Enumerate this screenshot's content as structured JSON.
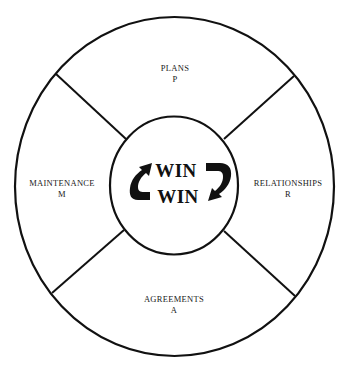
{
  "diagram": {
    "center": {
      "top_word": "WIN",
      "bottom_word": "WIN",
      "arrows": [
        "curved-arrow-up-left",
        "curved-arrow-down-right"
      ]
    },
    "segments": [
      {
        "position": "top",
        "title": "PLANS",
        "letter": "P"
      },
      {
        "position": "right",
        "title": "RELATIONSHIPS",
        "letter": "R"
      },
      {
        "position": "bottom",
        "title": "AGREEMENTS",
        "letter": "A"
      },
      {
        "position": "left",
        "title": "MAINTENANCE",
        "letter": "M"
      }
    ],
    "colors": {
      "stroke": "#111111",
      "background": "#ffffff",
      "text": "#1a1a1a"
    }
  }
}
